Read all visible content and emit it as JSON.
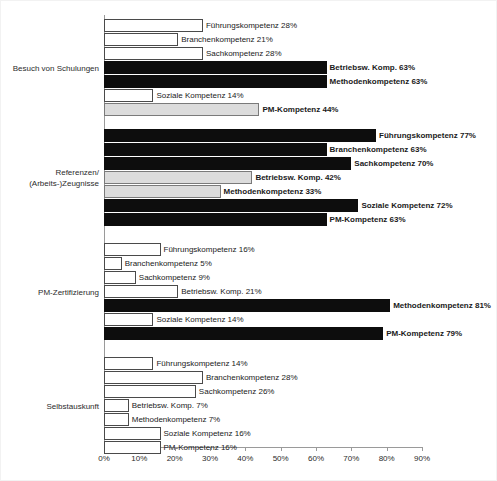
{
  "chart_data": {
    "type": "bar",
    "orientation": "horizontal",
    "grouped": true,
    "title": "",
    "subtitle": "",
    "xlabel": "",
    "ylabel": "",
    "xlim": [
      0,
      90
    ],
    "xtick_labels": [
      "0%",
      "10%",
      "20%",
      "30%",
      "40%",
      "50%",
      "60%",
      "70%",
      "80%",
      "90%"
    ],
    "xtick_values": [
      0,
      10,
      20,
      30,
      40,
      50,
      60,
      70,
      80,
      90
    ],
    "grid": false,
    "legend": "none",
    "value_suffix": "%",
    "series_names": [
      "Führungskompetenz",
      "Branchenkompetenz",
      "Sachkompetenz",
      "Betriebsw. Komp.",
      "Methodenkompetenz",
      "Soziale Kompetenz",
      "PM-Kompetenz"
    ],
    "categories": [
      "Besuch von Schulungen",
      "Referenzen/ (Arbeits-)Zeugnisse",
      "PM-Zertifizierung",
      "Selbstauskunft"
    ],
    "groups": [
      {
        "category": "Besuch von Schulungen",
        "category_lines": [
          "Besuch von Schulungen"
        ],
        "bars": [
          {
            "series": "Führungskompetenz",
            "value": 28,
            "label": "Führungskompetenz 28%",
            "style": "white",
            "bold": false
          },
          {
            "series": "Branchenkompetenz",
            "value": 21,
            "label": "Branchenkompetenz 21%",
            "style": "white",
            "bold": false
          },
          {
            "series": "Sachkompetenz",
            "value": 28,
            "label": "Sachkompetenz 28%",
            "style": "white",
            "bold": false
          },
          {
            "series": "Betriebsw. Komp.",
            "value": 63,
            "label": "Betriebsw. Komp. 63%",
            "style": "black",
            "bold": true
          },
          {
            "series": "Methodenkompetenz",
            "value": 63,
            "label": "Methodenkompetenz 63%",
            "style": "black",
            "bold": true
          },
          {
            "series": "Soziale Kompetenz",
            "value": 14,
            "label": "Soziale Kompetenz 14%",
            "style": "white",
            "bold": false
          },
          {
            "series": "PM-Kompetenz",
            "value": 44,
            "label": "PM-Kompetenz 44%",
            "style": "gray",
            "bold": true
          }
        ]
      },
      {
        "category": "Referenzen/ (Arbeits-)Zeugnisse",
        "category_lines": [
          "Referenzen/",
          "(Arbeits-)Zeugnisse"
        ],
        "bars": [
          {
            "series": "Führungskompetenz",
            "value": 77,
            "label": "Führungskompetenz 77%",
            "style": "black",
            "bold": true
          },
          {
            "series": "Branchenkompetenz",
            "value": 63,
            "label": "Branchenkompetenz 63%",
            "style": "black",
            "bold": true
          },
          {
            "series": "Sachkompetenz",
            "value": 70,
            "label": "Sachkompetenz 70%",
            "style": "black",
            "bold": true
          },
          {
            "series": "Betriebsw. Komp.",
            "value": 42,
            "label": "Betriebsw. Komp. 42%",
            "style": "gray",
            "bold": true
          },
          {
            "series": "Methodenkompetenz",
            "value": 33,
            "label": "Methodenkompetenz 33%",
            "style": "gray",
            "bold": true
          },
          {
            "series": "Soziale Kompetenz",
            "value": 72,
            "label": "Soziale Kompetenz 72%",
            "style": "black",
            "bold": true
          },
          {
            "series": "PM-Kompetenz",
            "value": 63,
            "label": "PM-Kompetenz 63%",
            "style": "black",
            "bold": true
          }
        ]
      },
      {
        "category": "PM-Zertifizierung",
        "category_lines": [
          "PM-Zertifizierung"
        ],
        "bars": [
          {
            "series": "Führungskompetenz",
            "value": 16,
            "label": "Führungskompetenz 16%",
            "style": "white",
            "bold": false
          },
          {
            "series": "Branchenkompetenz",
            "value": 5,
            "label": "Branchenkompetenz 5%",
            "style": "white",
            "bold": false
          },
          {
            "series": "Sachkompetenz",
            "value": 9,
            "label": "Sachkompetenz 9%",
            "style": "white",
            "bold": false
          },
          {
            "series": "Betriebsw. Komp.",
            "value": 21,
            "label": "Betriebsw. Komp. 21%",
            "style": "white",
            "bold": false
          },
          {
            "series": "Methodenkompetenz",
            "value": 81,
            "label": "Methodenkompetenz 81%",
            "style": "black",
            "bold": true
          },
          {
            "series": "Soziale Kompetenz",
            "value": 14,
            "label": "Soziale Kompetenz 14%",
            "style": "white",
            "bold": false
          },
          {
            "series": "PM-Kompetenz",
            "value": 79,
            "label": "PM-Kompetenz 79%",
            "style": "black",
            "bold": true
          }
        ]
      },
      {
        "category": "Selbstauskunft",
        "category_lines": [
          "Selbstauskunft"
        ],
        "bars": [
          {
            "series": "Führungskompetenz",
            "value": 14,
            "label": "Führungskompetenz 14%",
            "style": "white",
            "bold": false
          },
          {
            "series": "Branchenkompetenz",
            "value": 28,
            "label": "Branchenkompetenz 28%",
            "style": "white",
            "bold": false
          },
          {
            "series": "Sachkompetenz",
            "value": 26,
            "label": "Sachkompetenz 26%",
            "style": "white",
            "bold": false
          },
          {
            "series": "Betriebsw. Komp.",
            "value": 7,
            "label": "Betriebsw. Komp. 7%",
            "style": "white",
            "bold": false
          },
          {
            "series": "Methodenkompetenz",
            "value": 7,
            "label": "Methodenkompetenz 7%",
            "style": "white",
            "bold": false
          },
          {
            "series": "Soziale Kompetenz",
            "value": 16,
            "label": "Soziale Kompetenz 16%",
            "style": "white",
            "bold": false
          },
          {
            "series": "PM-Kompetenz",
            "value": 16,
            "label": "PM-Kompetenz 16%",
            "style": "white",
            "bold": false
          }
        ]
      }
    ]
  },
  "colors": {
    "bar_black": "#0d0d0d",
    "bar_gray": "#dcdcdc",
    "bar_white": "#ffffff",
    "bar_outline": "#4a4a4a",
    "axis": "#9a9a9a",
    "text": "#1a1a1a",
    "background": "#ffffff"
  }
}
